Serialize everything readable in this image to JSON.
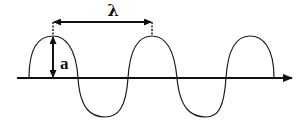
{
  "diagram": {
    "type": "transverse wave",
    "labels": {
      "wavelength": "λ",
      "amplitude": "a"
    },
    "colors": {
      "stroke": "#111111",
      "background": "#ffffff"
    },
    "wave": {
      "crests": 3,
      "troughs": 2,
      "axis_direction": "right"
    }
  }
}
